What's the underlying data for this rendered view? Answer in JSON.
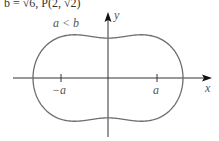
{
  "header": {
    "text": "b = √6,   P(2, √2)"
  },
  "diagram": {
    "condition_label": "a < b",
    "x_axis_label": "x",
    "y_axis_label": "y",
    "tick_labels": {
      "neg_a": "−a",
      "pos_a": "a"
    },
    "curve": {
      "type": "cassini-oval",
      "color": "#6e6e6e"
    },
    "axis_color": "#333333"
  }
}
